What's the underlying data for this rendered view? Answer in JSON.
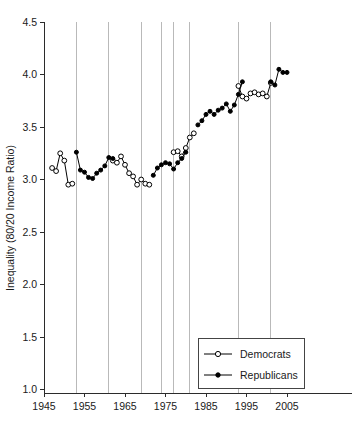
{
  "chart_data": {
    "type": "line",
    "title": "",
    "xlabel": "",
    "ylabel": "Inequality (80/20 Income Ratio)",
    "xlim": [
      1943,
      2007
    ],
    "ylim": [
      1.0,
      4.5
    ],
    "xticks": [
      1945,
      1955,
      1965,
      1975,
      1985,
      1995,
      2005
    ],
    "yticks": [
      "1.0",
      "1.5",
      "2.0",
      "2.5",
      "3.0",
      "3.5",
      "4.0",
      "4.5"
    ],
    "grid": "vertical-only",
    "gridline_years": [
      1953,
      1961,
      1969,
      1974,
      1977,
      1981,
      1993,
      2001
    ],
    "legend_position": "bottom-right",
    "legend": [
      {
        "name": "Democrats",
        "marker": "open-circle"
      },
      {
        "name": "Republicans",
        "marker": "filled-circle"
      }
    ],
    "x": [
      1947,
      1948,
      1949,
      1950,
      1951,
      1952,
      1953,
      1954,
      1955,
      1956,
      1957,
      1958,
      1959,
      1960,
      1961,
      1962,
      1963,
      1964,
      1965,
      1966,
      1967,
      1968,
      1969,
      1970,
      1971,
      1972,
      1973,
      1974,
      1975,
      1976,
      1977,
      1978,
      1979,
      1980,
      1981,
      1982,
      1983,
      1984,
      1985,
      1986,
      1987,
      1988,
      1989,
      1990,
      1991,
      1992,
      1993,
      1994,
      1995,
      1996,
      1997,
      1998,
      1999,
      2000,
      2001,
      2002,
      2003,
      2004
    ],
    "series": [
      {
        "name": "Democrats",
        "marker": "open-circle",
        "points": [
          {
            "x": 1947,
            "y": 3.11
          },
          {
            "x": 1948,
            "y": 3.08
          },
          {
            "x": 1949,
            "y": 3.25
          },
          {
            "x": 1950,
            "y": 3.18
          },
          {
            "x": 1951,
            "y": 2.95
          },
          {
            "x": 1952,
            "y": 2.96
          },
          {
            "x": 1962,
            "y": 3.18
          },
          {
            "x": 1963,
            "y": 3.16
          },
          {
            "x": 1964,
            "y": 3.22
          },
          {
            "x": 1965,
            "y": 3.14
          },
          {
            "x": 1966,
            "y": 3.06
          },
          {
            "x": 1967,
            "y": 3.03
          },
          {
            "x": 1968,
            "y": 2.95
          },
          {
            "x": 1969,
            "y": 3.0
          },
          {
            "x": 1970,
            "y": 2.96
          },
          {
            "x": 1971,
            "y": 2.95
          },
          {
            "x": 1977,
            "y": 3.26
          },
          {
            "x": 1978,
            "y": 3.27
          },
          {
            "x": 1979,
            "y": 3.22
          },
          {
            "x": 1980,
            "y": 3.3
          },
          {
            "x": 1981,
            "y": 3.4
          },
          {
            "x": 1982,
            "y": 3.44
          },
          {
            "x": 1993,
            "y": 3.89
          },
          {
            "x": 1994,
            "y": 3.79
          },
          {
            "x": 1995,
            "y": 3.77
          },
          {
            "x": 1996,
            "y": 3.82
          },
          {
            "x": 1997,
            "y": 3.83
          },
          {
            "x": 1998,
            "y": 3.81
          },
          {
            "x": 1999,
            "y": 3.82
          },
          {
            "x": 2000,
            "y": 3.79
          },
          {
            "x": 2001,
            "y": 3.92
          }
        ]
      },
      {
        "name": "Republicans",
        "marker": "filled-circle",
        "points": [
          {
            "x": 1953,
            "y": 3.26
          },
          {
            "x": 1954,
            "y": 3.09
          },
          {
            "x": 1955,
            "y": 3.07
          },
          {
            "x": 1956,
            "y": 3.02
          },
          {
            "x": 1957,
            "y": 3.01
          },
          {
            "x": 1958,
            "y": 3.06
          },
          {
            "x": 1959,
            "y": 3.09
          },
          {
            "x": 1960,
            "y": 3.13
          },
          {
            "x": 1961,
            "y": 3.21
          },
          {
            "x": 1962,
            "y": 3.2
          },
          {
            "x": 1972,
            "y": 3.04
          },
          {
            "x": 1973,
            "y": 3.11
          },
          {
            "x": 1974,
            "y": 3.14
          },
          {
            "x": 1975,
            "y": 3.16
          },
          {
            "x": 1976,
            "y": 3.15
          },
          {
            "x": 1977,
            "y": 3.1
          },
          {
            "x": 1978,
            "y": 3.16
          },
          {
            "x": 1979,
            "y": 3.2
          },
          {
            "x": 1980,
            "y": 3.26
          },
          {
            "x": 1983,
            "y": 3.52
          },
          {
            "x": 1984,
            "y": 3.56
          },
          {
            "x": 1985,
            "y": 3.62
          },
          {
            "x": 1986,
            "y": 3.65
          },
          {
            "x": 1987,
            "y": 3.62
          },
          {
            "x": 1988,
            "y": 3.66
          },
          {
            "x": 1989,
            "y": 3.68
          },
          {
            "x": 1990,
            "y": 3.72
          },
          {
            "x": 1991,
            "y": 3.65
          },
          {
            "x": 1992,
            "y": 3.71
          },
          {
            "x": 1993,
            "y": 3.81
          },
          {
            "x": 1994,
            "y": 3.93
          },
          {
            "x": 2001,
            "y": 3.93
          },
          {
            "x": 2002,
            "y": 3.9
          },
          {
            "x": 2003,
            "y": 4.05
          },
          {
            "x": 2004,
            "y": 4.02
          },
          {
            "x": 2005,
            "y": 4.02
          }
        ]
      }
    ]
  }
}
